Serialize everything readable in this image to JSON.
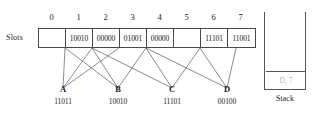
{
  "diagram": {
    "slots_label": "Slots",
    "column_headers": [
      "0",
      "1",
      "2",
      "3",
      "4",
      "5",
      "6",
      "7"
    ],
    "slots": [
      {
        "index": "0",
        "value": ""
      },
      {
        "index": "1",
        "value": "10010"
      },
      {
        "index": "2",
        "value": "00000"
      },
      {
        "index": "3",
        "value": "01001"
      },
      {
        "index": "4",
        "value": "00000"
      },
      {
        "index": "5",
        "value": ""
      },
      {
        "index": "6",
        "value": "11101"
      },
      {
        "index": "7",
        "value": "11001"
      }
    ],
    "keys": [
      {
        "name": "A",
        "value": "11011"
      },
      {
        "name": "B",
        "value": "10010"
      },
      {
        "name": "C",
        "value": "11101"
      },
      {
        "name": "D",
        "value": "00100"
      }
    ],
    "edges": [
      {
        "from_slot": 1,
        "to_key": "A"
      },
      {
        "from_slot": 2,
        "to_key": "A"
      },
      {
        "from_slot": 3,
        "to_key": "A"
      },
      {
        "from_slot": 1,
        "to_key": "B"
      },
      {
        "from_slot": 2,
        "to_key": "B"
      },
      {
        "from_slot": 4,
        "to_key": "B"
      },
      {
        "from_slot": 2,
        "to_key": "C"
      },
      {
        "from_slot": 4,
        "to_key": "C"
      },
      {
        "from_slot": 6,
        "to_key": "C"
      },
      {
        "from_slot": 4,
        "to_key": "D"
      },
      {
        "from_slot": 6,
        "to_key": "D"
      },
      {
        "from_slot": 7,
        "to_key": "D"
      }
    ],
    "stack": {
      "caption": "Stack",
      "top_entry": "D, 7"
    },
    "colors": {
      "line": "#4a4a4a",
      "edge": "#5a5a5a",
      "stack_entry_text": "#b9b9b9",
      "text": "#1c1c1c",
      "background": "#ffffff"
    }
  }
}
